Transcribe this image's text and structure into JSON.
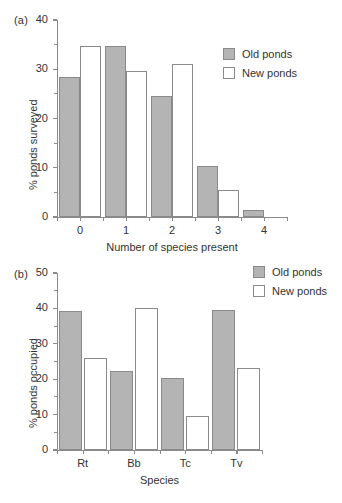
{
  "figure": {
    "background": "#ffffff",
    "bar_fill_old": "#b4b4b4",
    "bar_fill_new": "#ffffff",
    "bar_stroke": "#8a8a8a",
    "axis_color": "#8a8a8a"
  },
  "panel_a": {
    "label": "(a)",
    "legend": [
      {
        "key": "old",
        "label": "Old ponds"
      },
      {
        "key": "new",
        "label": "New ponds"
      }
    ]
  },
  "panel_b": {
    "label": "(b)",
    "legend": [
      {
        "key": "old",
        "label": "Old ponds"
      },
      {
        "key": "new",
        "label": "New ponds"
      }
    ]
  },
  "chart_data": [
    {
      "id": "panel-a",
      "type": "bar",
      "title": "(a)",
      "xlabel": "Number of species present",
      "ylabel": "% ponds surveyed",
      "categories": [
        "0",
        "1",
        "2",
        "3",
        "4"
      ],
      "series": [
        {
          "name": "Old ponds",
          "values": [
            28.5,
            34.8,
            24.6,
            10.3,
            1.4
          ]
        },
        {
          "name": "New ponds",
          "values": [
            34.7,
            29.7,
            31.1,
            5.4,
            0
          ]
        }
      ],
      "ylim": [
        0,
        40
      ],
      "yticks": [
        0,
        10,
        20,
        30,
        40
      ],
      "yticklabels": [
        "0",
        "10",
        "20",
        "30",
        "40"
      ],
      "yminorticks": [
        5,
        15,
        25,
        35
      ],
      "grid": false,
      "legend_position": "upper right"
    },
    {
      "id": "panel-b",
      "type": "bar",
      "title": "(b)",
      "xlabel": "Species",
      "ylabel": "% ponds occupied",
      "categories": [
        "Rt",
        "Bb",
        "Tc",
        "Tv"
      ],
      "series": [
        {
          "name": "Old ponds",
          "values": [
            39.4,
            22.3,
            20.3,
            39.5
          ]
        },
        {
          "name": "New ponds",
          "values": [
            26.1,
            40.1,
            9.5,
            23.2
          ]
        }
      ],
      "ylim": [
        0,
        50
      ],
      "yticks": [
        0,
        10,
        20,
        30,
        40,
        50
      ],
      "yticklabels": [
        "0",
        "10",
        "20",
        "30",
        "40",
        "50"
      ],
      "yminorticks": [
        5,
        15,
        25,
        35,
        45
      ],
      "grid": false,
      "legend_position": "upper right"
    }
  ]
}
